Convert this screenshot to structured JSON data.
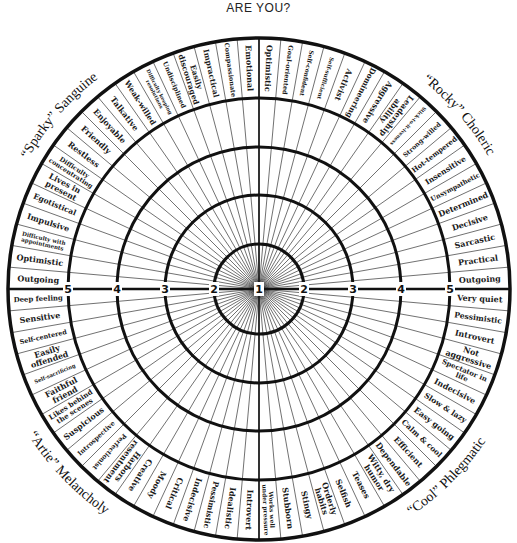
{
  "header": {
    "title": "ARE YOU?"
  },
  "colors": {
    "ink": "#111111",
    "background": "#ffffff"
  },
  "wheel": {
    "center": [
      259,
      289
    ],
    "scale_labels": [
      "1",
      "2",
      "3",
      "4",
      "5"
    ],
    "quadrants": [
      {
        "name": "top-right",
        "title": "“Rocky” Choleric",
        "traits": [
          "Optimistic",
          "Goal-oriented",
          "Self-confident",
          "Self-sufficient",
          "Activist",
          "Domineering",
          "Aggressive",
          "Leadership ability",
          "Stick-to-it-iveness",
          "Strong-willed",
          "Hot-tempered",
          "Insensitive",
          "Unsympathetic",
          "Determined",
          "Decisive",
          "Sarcastic",
          "Practical",
          "Outgoing"
        ]
      },
      {
        "name": "bottom-right",
        "title": "“Cool” Phlegmatic",
        "traits": [
          "Very quiet",
          "Pessimistic",
          "Introvert",
          "Not aggressive",
          "Spectator in life",
          "Indecisive",
          "Slow & lazy",
          "Easy going",
          "Calm & cool",
          "Efficient",
          "Dependable",
          "Witty, dry humor",
          "Teases",
          "Selfish",
          "Orderly habits",
          "Stingy",
          "Stubborn",
          "Works well under pressure"
        ]
      },
      {
        "name": "bottom-left",
        "title": "“Artie” Melancholy",
        "traits": [
          "Introvert",
          "Idealistic",
          "Pessimistic",
          "Indecisive",
          "Critical",
          "Moody",
          "Creative",
          "Harbors resentment",
          "Perfectionist",
          "Introspective",
          "Suspicious",
          "Likes behind the scenes",
          "Faithful friend",
          "Self-sacrificing",
          "Easily offended",
          "Self-centered",
          "Sensitive",
          "Deep feeling"
        ]
      },
      {
        "name": "top-left",
        "title": "“Sparky” Sanguine",
        "traits": [
          "Outgoing",
          "Optimistic",
          "Difficulty with appointments",
          "Impulsive",
          "Egotistical",
          "Lives in present",
          "Difficulty concentrating",
          "Restless",
          "Friendly",
          "Enjoyable",
          "Talkative",
          "Weak-willed",
          "Difficulty keeping resolutions",
          "Undisciplined",
          "Easily discouraged",
          "Impractical",
          "Compassionate",
          "Emotional"
        ]
      }
    ]
  }
}
